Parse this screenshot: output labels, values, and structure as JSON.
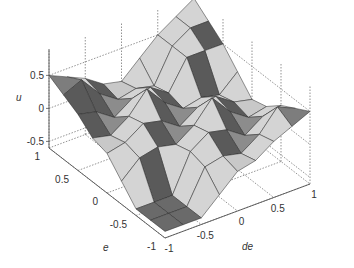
{
  "chart_data": {
    "type": "surface",
    "title": "",
    "xlabel": "de",
    "ylabel": "e",
    "zlabel": "u",
    "x_ticks": [
      -1,
      -0.5,
      0,
      0.5,
      1
    ],
    "y_ticks": [
      -1,
      -0.5,
      0,
      0.5,
      1
    ],
    "z_ticks": [
      -0.5,
      0,
      0.5
    ],
    "x_tick_labels": [
      "-1",
      "-0.5",
      "0",
      "0.5",
      "1"
    ],
    "y_tick_labels": [
      "-1",
      "-0.5",
      "0",
      "0.5",
      "1"
    ],
    "z_tick_labels": [
      "-0.5",
      "0",
      "0.5"
    ],
    "xlim": [
      -1,
      1
    ],
    "ylim": [
      -1,
      1
    ],
    "zlim": [
      -0.6,
      0.9
    ],
    "grid": true,
    "colormap": "gray",
    "grid_points": [
      -1,
      -0.75,
      -0.5,
      -0.25,
      0,
      0.25,
      0.5,
      0.75,
      1
    ]
  },
  "figure": {
    "background": "#ffffff",
    "face_light": "#d4d4d4",
    "face_mid": "#8c8c8c",
    "face_dark": "#5a5a5a",
    "edge_color": "#2a2a2a",
    "axis_color": "#555555"
  }
}
